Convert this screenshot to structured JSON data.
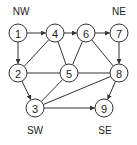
{
  "diagram": {
    "type": "directed-graph",
    "corner_labels": [
      {
        "id": "NW",
        "text": "NW",
        "x": 21,
        "y": 15
      },
      {
        "id": "NE",
        "text": "NE",
        "x": 119,
        "y": 15
      },
      {
        "id": "SW",
        "text": "SW",
        "x": 35,
        "y": 134
      },
      {
        "id": "SE",
        "text": "SE",
        "x": 105,
        "y": 134
      }
    ],
    "nodes": [
      {
        "id": "1",
        "label": "1",
        "x": 18,
        "y": 33
      },
      {
        "id": "2",
        "label": "2",
        "x": 18,
        "y": 73
      },
      {
        "id": "3",
        "label": "3",
        "x": 35,
        "y": 108
      },
      {
        "id": "4",
        "label": "4",
        "x": 55,
        "y": 33
      },
      {
        "id": "5",
        "label": "5",
        "x": 69,
        "y": 73
      },
      {
        "id": "6",
        "label": "6",
        "x": 86,
        "y": 33
      },
      {
        "id": "7",
        "label": "7",
        "x": 119,
        "y": 33
      },
      {
        "id": "8",
        "label": "8",
        "x": 119,
        "y": 73
      },
      {
        "id": "9",
        "label": "9",
        "x": 104,
        "y": 108
      }
    ],
    "edges": [
      {
        "from": "1",
        "to": "4",
        "directed": true
      },
      {
        "from": "1",
        "to": "2",
        "directed": true
      },
      {
        "from": "4",
        "to": "6",
        "directed": true
      },
      {
        "from": "6",
        "to": "7",
        "directed": true
      },
      {
        "from": "7",
        "to": "8",
        "directed": true
      },
      {
        "from": "2",
        "to": "4",
        "directed": false
      },
      {
        "from": "4",
        "to": "5",
        "directed": false
      },
      {
        "from": "6",
        "to": "5",
        "directed": false
      },
      {
        "from": "6",
        "to": "8",
        "directed": false
      },
      {
        "from": "2",
        "to": "5",
        "directed": false
      },
      {
        "from": "5",
        "to": "8",
        "directed": false
      },
      {
        "from": "2",
        "to": "3",
        "directed": true
      },
      {
        "from": "3",
        "to": "5",
        "directed": false
      },
      {
        "from": "3",
        "to": "8",
        "directed": false
      },
      {
        "from": "3",
        "to": "9",
        "directed": true
      },
      {
        "from": "8",
        "to": "9",
        "directed": true
      }
    ],
    "node_radius": 9,
    "colors": {
      "stroke": "#333333",
      "fill": "#ffffff",
      "text": "#222222"
    }
  }
}
